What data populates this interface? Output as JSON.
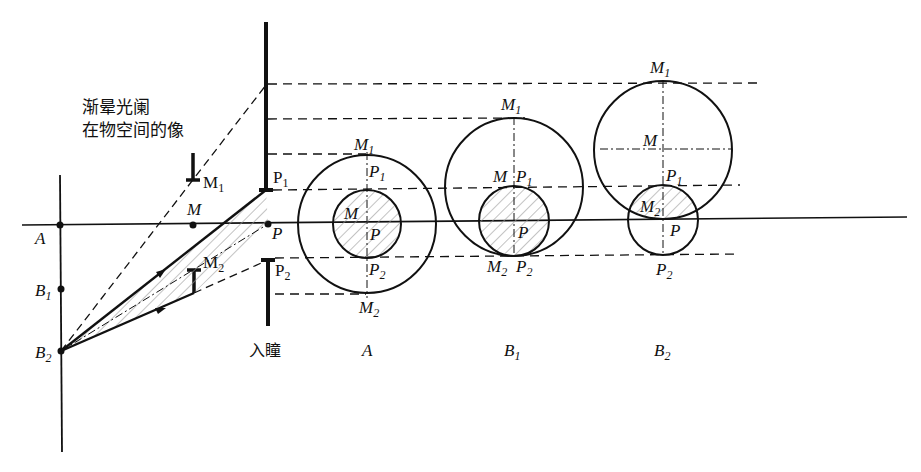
{
  "title": {
    "line1": "渐晕光阑",
    "line2": "在物空间的像"
  },
  "labels": {
    "entrance_pupil": "入瞳",
    "A": "A",
    "B1": "B",
    "B1_sub": "1",
    "B2": "B",
    "B2_sub": "2",
    "M": "M",
    "P": "P",
    "M1": "M",
    "M1_sub": "1",
    "M2": "M",
    "M2_sub": "2",
    "P1": "P",
    "P1_sub": "1",
    "P2": "P",
    "P2_sub": "2"
  },
  "cases": [
    {
      "id": "A",
      "label": "A",
      "sub": ""
    },
    {
      "id": "B1",
      "label": "B",
      "sub": "1"
    },
    {
      "id": "B2",
      "label": "B",
      "sub": "2"
    }
  ],
  "colors": {
    "line": "#111111",
    "hatch": "#9a9a9a",
    "background": "#ffffff"
  }
}
